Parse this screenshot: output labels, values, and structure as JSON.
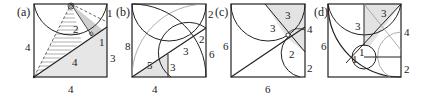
{
  "figure": {
    "panels": [
      {
        "id": "a",
        "label": "(a)",
        "side_labels": {
          "left": "4",
          "bottom": "4",
          "right": "3",
          "corner": "1"
        },
        "inner_labels": {
          "hatched": "2",
          "diagonal": "4",
          "small": "1"
        }
      },
      {
        "id": "b",
        "label": "(b)",
        "side_labels": {
          "left": "8",
          "bottom": "4",
          "right_top": "2",
          "right_mid": "6"
        },
        "inner_labels": {
          "hyp": "5",
          "leg": "3",
          "diag": "3",
          "small": "2"
        }
      },
      {
        "id": "c",
        "label": "(c)",
        "side_labels": {
          "left": "6",
          "bottom": "6",
          "right_top": "4",
          "right_bottom": "2"
        },
        "inner_labels": {
          "top": "3",
          "diag": "3",
          "mid": "2"
        }
      },
      {
        "id": "d",
        "label": "(d)",
        "side_labels": {
          "left": "6",
          "right_top": "4",
          "right_bottom": "2"
        },
        "inner_labels": {
          "top": "3",
          "vert": "3",
          "r1": "1",
          "r2": "1"
        }
      }
    ],
    "colors": {
      "stroke": "#222222",
      "shade": "#d8d8d8",
      "light_stroke": "#999999"
    }
  }
}
